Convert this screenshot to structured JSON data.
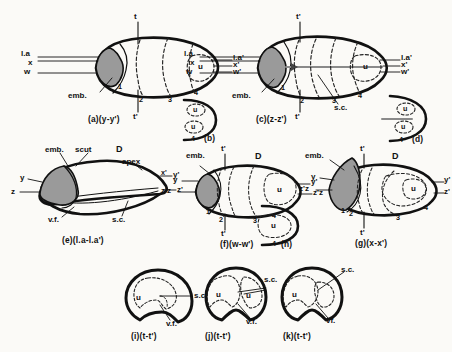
{
  "figure": {
    "background_color": "#fbfaf7",
    "ink_color": "#111111",
    "embryo_fill": "#9a9a9a",
    "dashed_color": "#333333"
  },
  "panels": [
    {
      "id": "a",
      "caption": "(a)(y-y')",
      "axis_top": "t",
      "axis_bottom": "t'",
      "left_labels": [
        "l.a",
        "x",
        "w"
      ],
      "right_labels": [
        "l.a'",
        "x'",
        "w'"
      ],
      "embryo_label": "emb.",
      "region_numbers": [
        "1",
        "2",
        "3",
        "4"
      ],
      "inner_label": "u"
    },
    {
      "id": "b",
      "caption": "(b)",
      "region_numbers": [
        "4"
      ],
      "inner_labels": [
        "u",
        "u"
      ]
    },
    {
      "id": "c",
      "caption": "(c)(z-z')",
      "axis_top": "t'",
      "axis_bottom": "t'",
      "left_labels": [
        "l.a",
        "x",
        "w"
      ],
      "right_labels": [
        "l.a'",
        "x'",
        "w'"
      ],
      "embryo_label": "emb.",
      "region_numbers": [
        "1",
        "2",
        "3",
        "4"
      ],
      "inner_label": "u",
      "extra_label": "s.c."
    },
    {
      "id": "d",
      "caption": "(d)",
      "region_numbers": [
        "4"
      ],
      "inner_labels": [
        "u",
        "u"
      ]
    },
    {
      "id": "e",
      "caption": "(e)(l.a-l.a')",
      "top_labels": [
        "emb.",
        "scut",
        "D",
        "apex"
      ],
      "left_labels": [
        "y",
        "z"
      ],
      "right_labels": [
        "y'",
        "z'"
      ],
      "bottom_labels": [
        "v.f.",
        "s.c."
      ]
    },
    {
      "id": "f",
      "caption": "(f)(w-w')",
      "axis_top": "t'",
      "axis_bottom": "t'",
      "top_labels": [
        "emb.",
        "D"
      ],
      "left_labels": [
        "y",
        "z'z"
      ],
      "left_outer": [
        "x'",
        "z'"
      ],
      "right_labels": [
        "y'",
        "z'z"
      ],
      "region_numbers": [
        "1",
        "2",
        "3",
        "4"
      ],
      "inner_label": "u"
    },
    {
      "id": "g",
      "caption": "(g)(x-x')",
      "axis_top": "t'",
      "axis_bottom": "t'",
      "top_labels": [
        "emb.",
        "D"
      ],
      "left_labels": [
        "y",
        "z'z"
      ],
      "right_labels": [
        "y'",
        "z'"
      ],
      "region_numbers": [
        "1",
        "2",
        "3",
        "4"
      ],
      "inner_label": "u"
    },
    {
      "id": "h",
      "caption": "4 (h)",
      "inner_label": "u"
    },
    {
      "id": "i",
      "caption": "(i)(t-t')",
      "inner_labels": [
        "u"
      ],
      "right_label": "s.c.",
      "bottom_label": "v.f."
    },
    {
      "id": "j",
      "caption": "(j)(t-t')",
      "inner_labels": [
        "u",
        "u"
      ],
      "right_label": "s.c.",
      "bottom_label": "v.f."
    },
    {
      "id": "k",
      "caption": "(k)(t-t')",
      "inner_labels": [
        "u"
      ],
      "right_label": "s.c.",
      "bottom_label": "vf."
    }
  ],
  "labels": {
    "a_t": "t",
    "a_tp": "t'",
    "a_la": "l.a",
    "a_x": "x",
    "a_w": "w",
    "a_lap": "l.a'",
    "a_xp": "x'",
    "a_wp": "w'",
    "a_emb": "emb.",
    "a_n1": "1",
    "a_n2": "2",
    "a_n3": "3",
    "a_n4": "4",
    "a_u": "u",
    "a_cap": "(a)(y-y')",
    "b_n4": "4",
    "b_u1": "u",
    "b_u2": "u",
    "b_cap": "(b)",
    "c_t1": "t'",
    "c_t2": "t'",
    "c_la": "l.a",
    "c_x": "x",
    "c_w": "w",
    "c_lap": "l.a'",
    "c_xp": "x'",
    "c_wp": "w'",
    "c_emb": "emb.",
    "c_n1": "1",
    "c_n2": "2",
    "c_n3": "3",
    "c_n4": "4",
    "c_u": "u",
    "c_sc": "s.c.",
    "c_cap": "(c)(z-z')",
    "d_n4": "4",
    "d_u1": "u",
    "d_u2": "u",
    "d_cap": "(d)",
    "e_emb": "emb.",
    "e_scut": "scut",
    "e_D": "D",
    "e_apex": "apex",
    "e_y": "y",
    "e_z": "z",
    "e_yp": "y'",
    "e_zp": "z'",
    "e_vf": "v.f.",
    "e_sc": "s.c.",
    "e_cap": "(e)(l.a-l.a')",
    "f_emb": "emb.",
    "f_D": "D",
    "f_t1": "t'",
    "f_t2": "t'",
    "f_y": "y",
    "f_zz": "z'z",
    "f_yp": "y'",
    "f_zp": "z'z",
    "f_xp": "x'",
    "f_zpp": "z'",
    "f_n1": "1",
    "f_n2": "2",
    "f_n3": "3",
    "f_n4": "4",
    "f_u": "u",
    "f_cap": "(f)(w-w')",
    "g_emb": "emb.",
    "g_D": "D",
    "g_t1": "t'",
    "g_t2": "t'",
    "g_y": "y",
    "g_zz": "z'z",
    "g_yp": "y'",
    "g_zp": "z'",
    "g_n1": "1",
    "g_n2": "2",
    "g_n3": "3",
    "g_n4": "4",
    "g_u": "u",
    "g_cap": "(g)(x-x')",
    "h_n4": "4",
    "h_u": "u",
    "h_cap": "(h)",
    "i_u": "u",
    "i_sc": "s.c.",
    "i_vf": "v.f.",
    "i_cap": "(i)(t-t')",
    "j_u1": "u",
    "j_u2": "u",
    "j_sc": "s.c.",
    "j_vf": "v.f.",
    "j_cap": "(j)(t-t')",
    "k_u": "u",
    "k_sc": "s.c.",
    "k_vf": "vf.",
    "k_cap": "(k)(t-t')"
  }
}
